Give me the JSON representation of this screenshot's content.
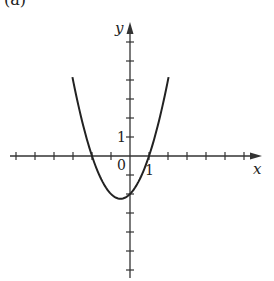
{
  "panel_label": "(a)",
  "chart_data": {
    "type": "line",
    "title": "",
    "xlabel": "x",
    "ylabel": "y",
    "function": "y = x^2 + x - 2",
    "xlim": [
      -6,
      6.8
    ],
    "ylim": [
      -6,
      6.8
    ],
    "grid": false,
    "legend": null,
    "tick_labels": {
      "origin": "0",
      "x_one": "1",
      "y_one": "1"
    },
    "tick_step": 1,
    "x_ticks": [
      -6,
      -5,
      -4,
      -3,
      -2,
      -1,
      1,
      2,
      3,
      4,
      5,
      6
    ],
    "y_ticks": [
      -6,
      -5,
      -4,
      -3,
      -2,
      -1,
      1,
      2,
      3,
      4,
      5,
      6
    ],
    "key_points": {
      "vertex": [
        -0.5,
        -2.25
      ],
      "y_intercept": [
        0,
        -2
      ],
      "x_intercepts": [
        [
          -2,
          0
        ],
        [
          1,
          0
        ]
      ]
    },
    "series": [
      {
        "name": "parabola",
        "x": [
          -3.03,
          -2.5,
          -2,
          -1.5,
          -1,
          -0.5,
          0,
          0.5,
          1,
          1.5,
          2.03
        ],
        "y": [
          6.15,
          1.75,
          0,
          -1.25,
          -2,
          -2.25,
          -2,
          -1.25,
          0,
          1.75,
          6.15
        ]
      }
    ]
  },
  "style": {
    "axis_color": "#333333",
    "curve_color": "#222222",
    "background": "#ffffff"
  }
}
